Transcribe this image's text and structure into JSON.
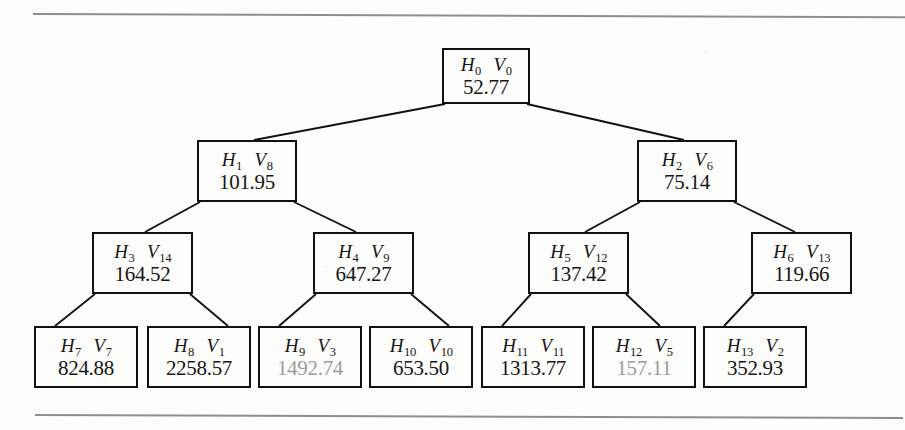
{
  "figure": {
    "kind": "binary-tree-diagram",
    "rule_color": "#8e8e8e",
    "box_border_color": "#111111",
    "text_color": "#161616",
    "dim_text_color": "#9c9c9c",
    "background_color": "#fdfdfc"
  },
  "nodes": [
    {
      "id": "n0",
      "h_label": "H",
      "h_sub": "0",
      "v_label": "V",
      "v_sub": "0",
      "value": "52.77",
      "dim": false,
      "x": 442,
      "y": 48,
      "w": 88,
      "h": 56,
      "level": 0
    },
    {
      "id": "n1",
      "h_label": "H",
      "h_sub": "1",
      "v_label": "V",
      "v_sub": "8",
      "value": "101.95",
      "dim": false,
      "x": 197,
      "y": 140,
      "w": 100,
      "h": 62,
      "level": 1
    },
    {
      "id": "n2",
      "h_label": "H",
      "h_sub": "2",
      "v_label": "V",
      "v_sub": "6",
      "value": "75.14",
      "dim": false,
      "x": 637,
      "y": 140,
      "w": 100,
      "h": 62,
      "level": 1
    },
    {
      "id": "n3",
      "h_label": "H",
      "h_sub": "3",
      "v_label": "V",
      "v_sub": "14",
      "value": "164.52",
      "dim": false,
      "x": 92,
      "y": 232,
      "w": 101,
      "h": 62,
      "level": 2
    },
    {
      "id": "n4",
      "h_label": "H",
      "h_sub": "4",
      "v_label": "V",
      "v_sub": "9",
      "value": "647.27",
      "dim": false,
      "x": 313,
      "y": 232,
      "w": 101,
      "h": 62,
      "level": 2
    },
    {
      "id": "n5",
      "h_label": "H",
      "h_sub": "5",
      "v_label": "V",
      "v_sub": "12",
      "value": "137.42",
      "dim": false,
      "x": 528,
      "y": 232,
      "w": 101,
      "h": 62,
      "level": 2
    },
    {
      "id": "n6",
      "h_label": "H",
      "h_sub": "6",
      "v_label": "V",
      "v_sub": "13",
      "value": "119.66",
      "dim": false,
      "x": 751,
      "y": 232,
      "w": 101,
      "h": 62,
      "level": 2
    },
    {
      "id": "n7",
      "h_label": "H",
      "h_sub": "7",
      "v_label": "V",
      "v_sub": "7",
      "value": "824.88",
      "dim": false,
      "x": 34,
      "y": 326,
      "w": 104,
      "h": 62,
      "level": 3
    },
    {
      "id": "n8",
      "h_label": "H",
      "h_sub": "8",
      "v_label": "V",
      "v_sub": "1",
      "value": "2258.57",
      "dim": false,
      "x": 147,
      "y": 326,
      "w": 104,
      "h": 62,
      "level": 3
    },
    {
      "id": "n9",
      "h_label": "H",
      "h_sub": "9",
      "v_label": "V",
      "v_sub": "3",
      "value": "1492.74",
      "dim": true,
      "x": 258,
      "y": 326,
      "w": 104,
      "h": 62,
      "level": 3
    },
    {
      "id": "n10",
      "h_label": "H",
      "h_sub": "10",
      "v_label": "V",
      "v_sub": "10",
      "value": "653.50",
      "dim": false,
      "x": 369,
      "y": 326,
      "w": 104,
      "h": 62,
      "level": 3
    },
    {
      "id": "n11",
      "h_label": "H",
      "h_sub": "11",
      "v_label": "V",
      "v_sub": "11",
      "value": "1313.77",
      "dim": false,
      "x": 481,
      "y": 326,
      "w": 104,
      "h": 62,
      "level": 3
    },
    {
      "id": "n12",
      "h_label": "H",
      "h_sub": "12",
      "v_label": "V",
      "v_sub": "5",
      "value": "157.11",
      "dim": true,
      "x": 592,
      "y": 326,
      "w": 104,
      "h": 62,
      "level": 3
    },
    {
      "id": "n13",
      "h_label": "H",
      "h_sub": "13",
      "v_label": "V",
      "v_sub": "2",
      "value": "352.93",
      "dim": false,
      "x": 703,
      "y": 326,
      "w": 104,
      "h": 62,
      "level": 3
    }
  ],
  "edges": [
    {
      "from": "n0",
      "to": "n1",
      "x1": 445,
      "y1": 104,
      "x2": 254,
      "y2": 140
    },
    {
      "from": "n0",
      "to": "n2",
      "x1": 527,
      "y1": 104,
      "x2": 684,
      "y2": 140
    },
    {
      "from": "n1",
      "to": "n3",
      "x1": 200,
      "y1": 202,
      "x2": 145,
      "y2": 232
    },
    {
      "from": "n1",
      "to": "n4",
      "x1": 294,
      "y1": 202,
      "x2": 356,
      "y2": 232
    },
    {
      "from": "n2",
      "to": "n5",
      "x1": 640,
      "y1": 202,
      "x2": 585,
      "y2": 232
    },
    {
      "from": "n2",
      "to": "n6",
      "x1": 734,
      "y1": 202,
      "x2": 795,
      "y2": 232
    },
    {
      "from": "n3",
      "to": "n7",
      "x1": 95,
      "y1": 294,
      "x2": 55,
      "y2": 326
    },
    {
      "from": "n3",
      "to": "n8",
      "x1": 190,
      "y1": 294,
      "x2": 228,
      "y2": 326
    },
    {
      "from": "n4",
      "to": "n9",
      "x1": 316,
      "y1": 294,
      "x2": 279,
      "y2": 326
    },
    {
      "from": "n4",
      "to": "n10",
      "x1": 411,
      "y1": 294,
      "x2": 449,
      "y2": 326
    },
    {
      "from": "n5",
      "to": "n11",
      "x1": 531,
      "y1": 294,
      "x2": 502,
      "y2": 326
    },
    {
      "from": "n5",
      "to": "n12",
      "x1": 626,
      "y1": 294,
      "x2": 660,
      "y2": 326
    },
    {
      "from": "n6",
      "to": "n13",
      "x1": 754,
      "y1": 294,
      "x2": 724,
      "y2": 326
    }
  ],
  "rules": [
    {
      "name": "top-rule"
    },
    {
      "name": "bottom-rule"
    }
  ]
}
